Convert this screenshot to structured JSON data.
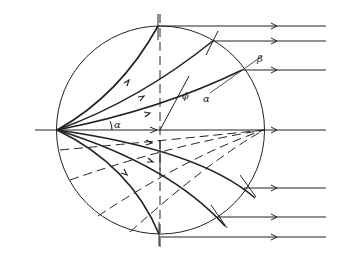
{
  "diagram": {
    "colors": {
      "stroke": "#222222",
      "background": "#ffffff"
    },
    "labels": {
      "alpha_center": "α",
      "alpha_ray": "α",
      "beta": "β",
      "phi": "ϕ"
    },
    "solid_ray_count_upper": 3,
    "solid_ray_count_lower": 3,
    "dashed_ray_count": 3,
    "emergent_parallel_ray_count": 7,
    "axis_ray": "principal axis through center"
  }
}
